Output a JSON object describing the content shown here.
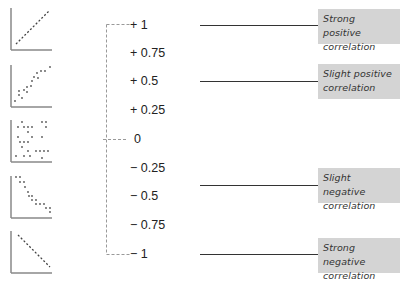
{
  "diagram": {
    "scale": [
      {
        "value": 1,
        "label": "+ 1"
      },
      {
        "value": 0.75,
        "label": "+ 0.75"
      },
      {
        "value": 0.5,
        "label": "+ 0.5"
      },
      {
        "value": 0.25,
        "label": "+ 0.25"
      },
      {
        "value": 0,
        "label": "0"
      },
      {
        "value": -0.25,
        "label": "− 0.25"
      },
      {
        "value": -0.5,
        "label": "− 0.5"
      },
      {
        "value": -0.75,
        "label": "− 0.75"
      },
      {
        "value": -1,
        "label": "− 1"
      }
    ],
    "categories": [
      {
        "line1": "Strong positive",
        "line2": "correlation",
        "points_to": "+ 1"
      },
      {
        "line1": "Slight positive",
        "line2": "correlation",
        "points_to": "+ 0.5"
      },
      {
        "line1": "Slight negative",
        "line2": "correlation",
        "points_to": "between − 0.25 and − 0.5"
      },
      {
        "line1": "Strong negative",
        "line2": "correlation",
        "points_to": "− 1"
      }
    ],
    "scatter_thumbnails": [
      {
        "name": "strong-positive",
        "description": "points along rising diagonal line"
      },
      {
        "name": "slight-positive",
        "description": "points loosely along rising diagonal"
      },
      {
        "name": "no-correlation",
        "description": "randomly scattered points"
      },
      {
        "name": "slight-negative",
        "description": "points loosely along falling diagonal"
      },
      {
        "name": "strong-negative",
        "description": "points along falling diagonal line"
      }
    ],
    "bracket": {
      "top": "+ 1",
      "middle": "0",
      "bottom": "− 1"
    },
    "colors": {
      "box_fill": "#d4d4d4",
      "line": "#333333",
      "axis": "#888888",
      "dash": "#999999"
    }
  }
}
